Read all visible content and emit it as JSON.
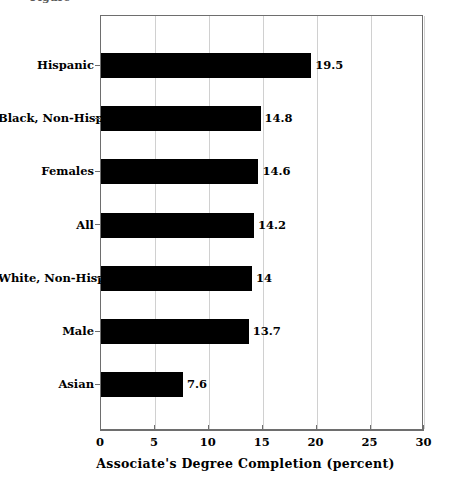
{
  "title_fragment": "Figure",
  "chart_data": {
    "type": "bar",
    "orientation": "horizontal",
    "title": "",
    "xlabel": "Associate's Degree Completion (percent)",
    "ylabel": "",
    "categories": [
      "Hispanic",
      "Black, Non-Hisp",
      "Females",
      "All",
      "White, Non-Hisp",
      "Male",
      "Asian"
    ],
    "values": [
      19.5,
      14.8,
      14.6,
      14.2,
      14,
      13.7,
      7.6
    ],
    "value_labels": [
      "19.5",
      "14.8",
      "14.6",
      "14.2",
      "14",
      "13.7",
      "7.6"
    ],
    "xlim": [
      0,
      30
    ],
    "xticks": [
      0,
      5,
      10,
      15,
      20,
      25,
      30
    ],
    "xtick_labels": [
      "0",
      "5",
      "10",
      "15",
      "20",
      "25",
      "30"
    ],
    "grid": true,
    "grid_axis": "x",
    "legend": null,
    "bar_color": "#000000",
    "grid_color": "#d0d0d0",
    "frame_color": "#6e6e6e"
  }
}
